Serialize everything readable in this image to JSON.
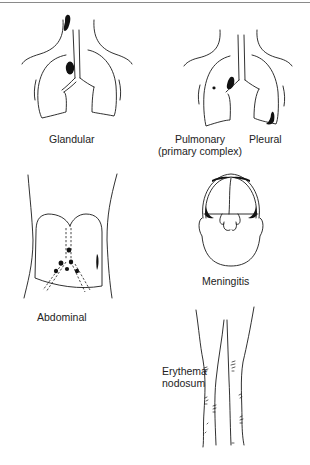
{
  "figure": {
    "panels": [
      {
        "id": "glandular",
        "label": "Glandular"
      },
      {
        "id": "pulmonary",
        "label": "Pulmonary",
        "sublabel": "(primary complex)"
      },
      {
        "id": "pleural",
        "label": "Pleural"
      },
      {
        "id": "abdominal",
        "label": "Abdominal"
      },
      {
        "id": "meningitis",
        "label": "Meningitis"
      },
      {
        "id": "erythema-nodosum",
        "label_line1": "Erythema",
        "label_line2": "nodosum"
      }
    ],
    "colors": {
      "line": "#1a1a1a",
      "lesion": "#111111",
      "background": "#ffffff",
      "rule": "#8a8a8a"
    }
  }
}
